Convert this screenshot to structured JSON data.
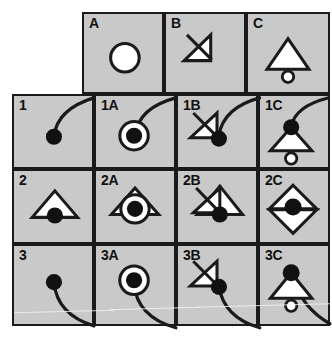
{
  "diagram": {
    "background_color": "#ffffff",
    "cell_fill": "#c9c9c9",
    "stroke_color": "#1a1a1a",
    "shape_fill": "#ffffff",
    "dot_fill": "#111111",
    "columns": [
      "",
      "A",
      "B",
      "C"
    ],
    "rows": [
      "",
      "1",
      "2",
      "3"
    ],
    "cells": [
      {
        "id": "header-a",
        "label": "A",
        "col": 1,
        "row": 0,
        "symbols": [
          "open-circle"
        ],
        "description": "large white circle"
      },
      {
        "id": "header-b",
        "label": "B",
        "col": 2,
        "row": 0,
        "symbols": [
          "crossed-right-triangle"
        ],
        "description": "right triangle with diagonal slash"
      },
      {
        "id": "header-c",
        "label": "C",
        "col": 3,
        "row": 0,
        "symbols": [
          "triangle",
          "small-open-circle"
        ],
        "description": "white triangle above small white circle"
      },
      {
        "id": "row-1",
        "label": "1",
        "col": 0,
        "row": 1,
        "symbols": [
          "filled-dot",
          "curve-up-right"
        ],
        "description": "black dot with curve rising to the right"
      },
      {
        "id": "cell-1a",
        "label": "1A",
        "col": 1,
        "row": 1,
        "symbols": [
          "open-circle",
          "filled-dot",
          "curve-up-right"
        ],
        "description": "dot inside circle with curve rising to the right"
      },
      {
        "id": "cell-1b",
        "label": "1B",
        "col": 2,
        "row": 1,
        "symbols": [
          "crossed-right-triangle",
          "filled-dot",
          "curve-up-right"
        ],
        "description": "crossed triangle with dot at its corner and curve rising"
      },
      {
        "id": "cell-1c",
        "label": "1C",
        "col": 3,
        "row": 1,
        "symbols": [
          "triangle",
          "small-open-circle",
          "filled-dot",
          "curve-up-right"
        ],
        "description": "dot atop triangle with small circle below and curve rising"
      },
      {
        "id": "row-2",
        "label": "2",
        "col": 0,
        "row": 2,
        "symbols": [
          "triangle",
          "filled-dot"
        ],
        "description": "white triangle with black dot at its base centre"
      },
      {
        "id": "cell-2a",
        "label": "2A",
        "col": 1,
        "row": 2,
        "symbols": [
          "triangle",
          "open-circle",
          "filled-dot"
        ],
        "description": "triangle overlapping circle with dot, eye-like"
      },
      {
        "id": "cell-2b",
        "label": "2B",
        "col": 2,
        "row": 2,
        "symbols": [
          "triangle",
          "crossed-right-triangle",
          "filled-dot"
        ],
        "description": "triangle with crossed triangle on its left and dot at base"
      },
      {
        "id": "cell-2c",
        "label": "2C",
        "col": 3,
        "row": 2,
        "symbols": [
          "triangle",
          "inverted-triangle",
          "filled-dot"
        ],
        "description": "two triangles meeting at a black dot"
      },
      {
        "id": "row-3",
        "label": "3",
        "col": 0,
        "row": 3,
        "symbols": [
          "filled-dot",
          "curve-down-right"
        ],
        "description": "black dot with curve descending to the right"
      },
      {
        "id": "cell-3a",
        "label": "3A",
        "col": 1,
        "row": 3,
        "symbols": [
          "open-circle",
          "filled-dot",
          "curve-down-right"
        ],
        "description": "dot inside circle with curve descending to the right"
      },
      {
        "id": "cell-3b",
        "label": "3B",
        "col": 2,
        "row": 3,
        "symbols": [
          "crossed-right-triangle",
          "filled-dot",
          "curve-down-right"
        ],
        "description": "crossed triangle with dot and curve descending"
      },
      {
        "id": "cell-3c",
        "label": "3C",
        "col": 3,
        "row": 3,
        "symbols": [
          "triangle",
          "small-open-circle",
          "filled-dot",
          "curve-down-right"
        ],
        "description": "dot atop triangle with small circle below and curve descending"
      }
    ]
  }
}
